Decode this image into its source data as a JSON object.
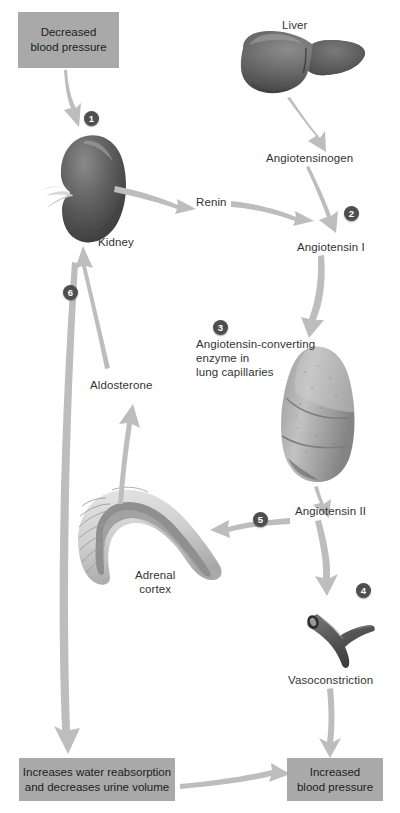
{
  "diagram": {
    "accent_box_color": "#a9a9a9",
    "badge_color": "#4e4e4e",
    "arrow_color": "#b5b5b5",
    "text_color": "#333333"
  },
  "boxes": [
    {
      "id": "decreased-bp",
      "label": "Decreased\nblood pressure",
      "x": 18,
      "y": 12,
      "w": 101,
      "h": 56
    },
    {
      "id": "increases-water",
      "label": "Increases water reabsorption\nand decreases urine volume",
      "x": 19,
      "y": 758,
      "w": 156,
      "h": 43
    },
    {
      "id": "increased-bp",
      "label": "Increased\nblood pressure",
      "x": 287,
      "y": 758,
      "w": 96,
      "h": 43
    }
  ],
  "labels": [
    {
      "id": "liver",
      "text": "Liver",
      "x": 282,
      "y": 18
    },
    {
      "id": "angiotensinogen",
      "text": "Angiotensinogen",
      "x": 266,
      "y": 151
    },
    {
      "id": "kidney",
      "text": "Kidney",
      "x": 98,
      "y": 235
    },
    {
      "id": "renin",
      "text": "Renin",
      "x": 196,
      "y": 195
    },
    {
      "id": "angiotensin-i",
      "text": "Angiotensin I",
      "x": 297,
      "y": 240
    },
    {
      "id": "ace",
      "text": "Angiotensin-converting\nenzyme in\nlung capillaries",
      "x": 196,
      "y": 337
    },
    {
      "id": "aldosterone",
      "text": "Aldosterone",
      "x": 90,
      "y": 378
    },
    {
      "id": "angiotensin-ii",
      "text": "Angiotensin II",
      "x": 295,
      "y": 504
    },
    {
      "id": "adrenal-cortex",
      "text": "Adrenal\ncortex",
      "x": 135,
      "y": 568
    },
    {
      "id": "vasoconstriction",
      "text": "Vasoconstriction",
      "x": 288,
      "y": 673
    }
  ],
  "badges": [
    {
      "id": "step-1",
      "number": "1",
      "x": 84,
      "y": 111
    },
    {
      "id": "step-2",
      "number": "2",
      "x": 344,
      "y": 206
    },
    {
      "id": "step-3",
      "number": "3",
      "x": 213,
      "y": 320
    },
    {
      "id": "step-4",
      "number": "4",
      "x": 356,
      "y": 583
    },
    {
      "id": "step-5",
      "number": "5",
      "x": 253,
      "y": 512
    },
    {
      "id": "step-6",
      "number": "6",
      "x": 63,
      "y": 285
    }
  ],
  "organs": [
    {
      "id": "liver",
      "name": "liver-illustration"
    },
    {
      "id": "kidney",
      "name": "kidney-illustration"
    },
    {
      "id": "lung",
      "name": "lung-illustration"
    },
    {
      "id": "adrenal",
      "name": "adrenal-gland-illustration"
    },
    {
      "id": "vessel",
      "name": "blood-vessel-illustration"
    }
  ],
  "flow_steps": [
    {
      "step": "1",
      "from": "Decreased blood pressure",
      "to": "Kidney"
    },
    {
      "step": "2",
      "from": "Angiotensinogen + Renin",
      "to": "Angiotensin I"
    },
    {
      "step": "3",
      "from": "Angiotensin I",
      "to": "Angiotensin-converting enzyme in lung capillaries"
    },
    {
      "step": "4",
      "from": "Angiotensin II",
      "to": "Vasoconstriction"
    },
    {
      "step": "5",
      "from": "Angiotensin II",
      "to": "Adrenal cortex"
    },
    {
      "step": "6",
      "from": "Aldosterone",
      "to": "Kidney"
    }
  ]
}
